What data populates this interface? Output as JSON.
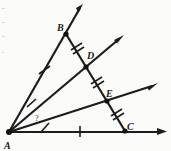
{
  "figure": {
    "background_color": "#fbfbfa",
    "ink_color": "#1c1c1c",
    "labels": {
      "vertex_a": "A",
      "point_b": "B",
      "point_c": "C",
      "point_d": "D",
      "point_e": "E",
      "unknown_angle": "?"
    },
    "points": [
      {
        "name": "A",
        "label": "A",
        "x": 9,
        "y": 132,
        "label_x": 6,
        "label_y": 147
      },
      {
        "name": "B",
        "label": "B",
        "x": 66,
        "y": 34,
        "label_x": 59,
        "label_y": 31
      },
      {
        "name": "D",
        "label": "D",
        "x": 86,
        "y": 63,
        "label_x": 86,
        "label_y": 58
      },
      {
        "name": "E",
        "label": "E",
        "x": 107,
        "y": 100,
        "label_x": 105,
        "label_y": 97
      },
      {
        "name": "C",
        "label": "C",
        "x": 125,
        "y": 131,
        "label_x": 124,
        "label_y": 129
      }
    ],
    "rays": [
      {
        "name": "ray-AB",
        "from": "A",
        "to_x": 83,
        "to_y": 4,
        "arrow": true
      },
      {
        "name": "ray-AD",
        "from": "A",
        "to_x": 123,
        "to_y": 36,
        "arrow": true
      },
      {
        "name": "ray-AE",
        "from": "A",
        "to_x": 157,
        "to_y": 84,
        "arrow": true
      },
      {
        "name": "ray-AC",
        "from": "A",
        "to_x": 166,
        "to_y": 132,
        "arrow": true
      }
    ],
    "transversal": {
      "name": "segment-BC",
      "from_x": 66,
      "from_y": 34,
      "to_x": 125,
      "to_y": 131
    },
    "tick_marks": [
      {
        "name": "tick-AB-mid",
        "x": 44,
        "y": 70,
        "angle": 30,
        "count": 1
      },
      {
        "name": "tick-BD",
        "x": 76,
        "y": 49,
        "angle": 30,
        "count": 2
      },
      {
        "name": "tick-DE",
        "x": 96,
        "y": 82,
        "angle": 30,
        "count": 2
      },
      {
        "name": "tick-EC",
        "x": 116,
        "y": 116,
        "angle": 30,
        "count": 2
      },
      {
        "name": "tick-ray-AD",
        "x": 31,
        "y": 103,
        "angle": 112,
        "count": 1
      },
      {
        "name": "tick-ray-AE",
        "x": 45,
        "y": 127,
        "angle": 100,
        "count": 1
      },
      {
        "name": "tick-base-AC",
        "x": 80,
        "y": 131,
        "angle": 90,
        "count": 1
      }
    ],
    "angle_marker": {
      "name": "unknown-angle-marker",
      "text": "?",
      "x": 36,
      "y": 118
    }
  }
}
